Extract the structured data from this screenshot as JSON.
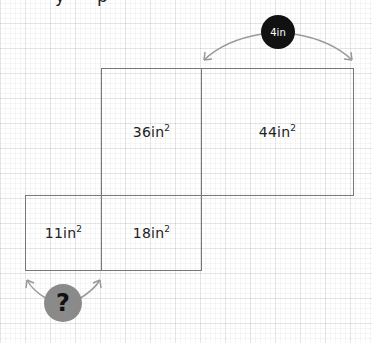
{
  "header": {
    "cut_off_text": "Find the missing side length"
  },
  "diagram": {
    "boxes": [
      {
        "id": "top-middle",
        "label": "36in",
        "exponent": "2"
      },
      {
        "id": "top-right",
        "label": "44in",
        "exponent": "2"
      },
      {
        "id": "bottom-left",
        "label": "11in",
        "exponent": "2"
      },
      {
        "id": "bottom-middle",
        "label": "18in",
        "exponent": "2"
      }
    ],
    "known_length": {
      "label": "4in",
      "applies_to": "top-right width"
    },
    "unknown_length": {
      "label": "?",
      "applies_to": "bottom-left width"
    }
  },
  "colors": {
    "grid": "#e6e6e6",
    "box_border": "#777777",
    "text": "#222222",
    "known_badge": "#111111",
    "unknown_badge": "#8a8a8a",
    "arrow": "#999999"
  }
}
